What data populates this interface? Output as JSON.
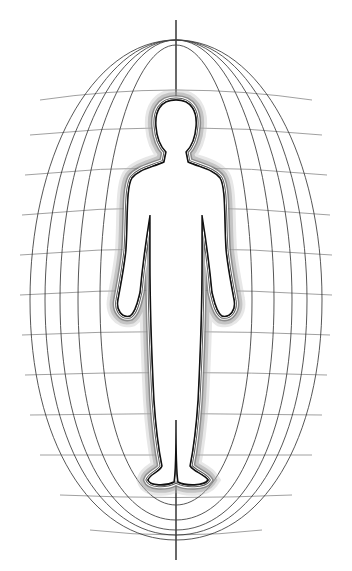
{
  "image": {
    "subject": "Human figure silhouette inside an oval energy field",
    "description": "Line drawing of a standing human outline surrounded by concentric glowing contour lines and an ellipsoidal field of vertical meridian arcs crossed by horizontal latitude lines, with a central vertical axis line.",
    "colors": {
      "background": "#ffffff",
      "line": "#222222",
      "glow": "#9a9a9a"
    }
  }
}
